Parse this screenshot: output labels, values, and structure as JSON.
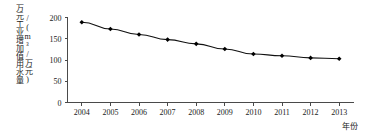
{
  "chart_data": {
    "type": "line",
    "title": "",
    "subtitle": "",
    "xlabel": "年份",
    "ylabel": "万元工业增加值用水量",
    "ylabel_unit": "/(m³/万元)",
    "categories": [
      "2004",
      "2005",
      "2006",
      "2007",
      "2008",
      "2009",
      "2010",
      "2011",
      "2012",
      "2013"
    ],
    "values": [
      189,
      173,
      160,
      148,
      138,
      126,
      114,
      110,
      105,
      103
    ],
    "series": [
      {
        "name": "万元工业增加值用水量",
        "values": [
          189,
          173,
          160,
          148,
          138,
          126,
          114,
          110,
          105,
          103
        ]
      }
    ],
    "ylim": [
      0,
      200
    ],
    "yticks": [
      0,
      50,
      100,
      150,
      200
    ],
    "ytick_labels": [
      "0",
      "50",
      "100",
      "150",
      "200"
    ],
    "xtick_labels": [
      "2004",
      "2005",
      "2006",
      "2007",
      "2008",
      "2009",
      "2010",
      "2011",
      "2012",
      "2013"
    ],
    "grid": false,
    "legend": false,
    "legend_position": "none",
    "marker": "diamond",
    "line_color": "#111111",
    "marker_color": "#000000",
    "axis_color": "#4a4a4a",
    "background_color": "#ffffff"
  }
}
